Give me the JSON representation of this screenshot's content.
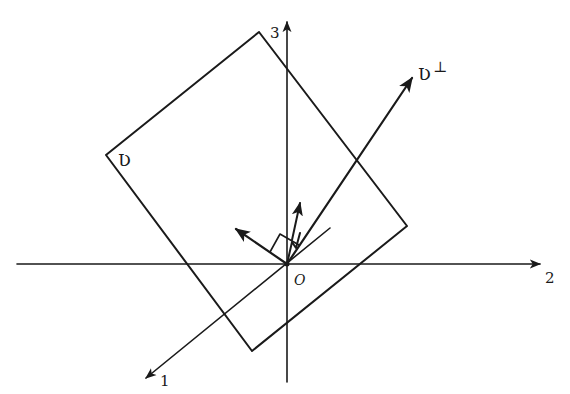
{
  "diagram": {
    "title": "",
    "axes": [
      {
        "id": "axis-1",
        "label": "1"
      },
      {
        "id": "axis-2",
        "label": "2"
      },
      {
        "id": "axis-3",
        "label": "3"
      }
    ],
    "origin_label": "O",
    "plane_label": "Ʋ",
    "orthogonal_label": "Ʋ",
    "orthogonal_superscript": "⊥",
    "colors": {
      "ink": "#1a1a1a",
      "background": "#ffffff"
    }
  }
}
